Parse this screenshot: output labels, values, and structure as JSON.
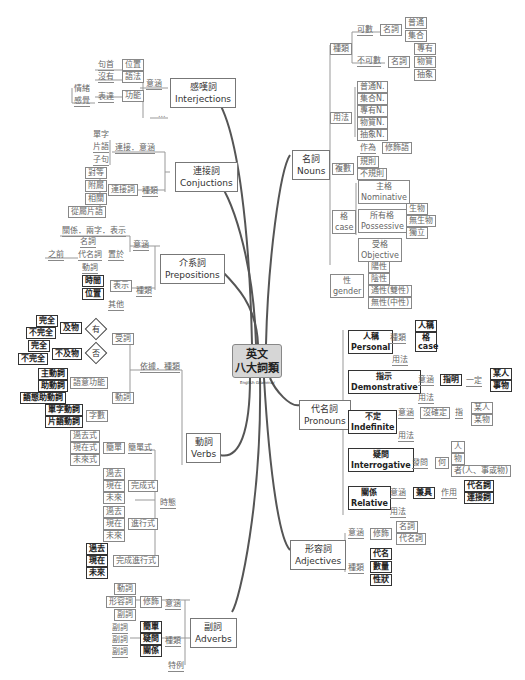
{
  "center": {
    "title_line1": "英文",
    "title_line2": "八大詞類",
    "subtitle": "English Grammar"
  },
  "interjections": {
    "zh": "感嘆詞",
    "en": "Interjections",
    "meaning": "意涵",
    "items": [
      {
        "left": "句首",
        "box": "位置"
      },
      {
        "left": "沒有",
        "box": "語法"
      },
      {
        "left": "表達",
        "box": "功能",
        "sub": [
          "情緒",
          "感覺"
        ]
      }
    ],
    "extra": "..."
  },
  "conjunctions": {
    "zh": "連接詞",
    "en": "Conjuctions",
    "meaning_label": "連接．意涵",
    "meaning_items": [
      "單字",
      "片語",
      "子句"
    ],
    "type_label": "種類",
    "type_box": "連接詞",
    "types": [
      "對等",
      "附屬",
      "相關",
      "從屬片語"
    ]
  },
  "prepositions": {
    "zh": "介系詞",
    "en": "Prepositions",
    "meaning": "意涵",
    "relation": "關係．兩字．表示",
    "placed": "置於",
    "before": "之前",
    "placed_items": [
      "名詞",
      "代名詞",
      "動詞"
    ],
    "type": "種類",
    "show": "表示",
    "show_items": [
      "時間",
      "位置"
    ],
    "other": "其他"
  },
  "verbs": {
    "zh": "動詞",
    "en": "Verbs",
    "basis": "依據．種類",
    "passive": "受詞",
    "yes": "有",
    "no": "否",
    "transitive": "及物",
    "intransitive": "不及物",
    "trans_items": [
      "完全",
      "不完全"
    ],
    "intrans_items": [
      "完全",
      "不完全"
    ],
    "verb": "動詞",
    "function": "語意功能",
    "function_items": [
      "主動詞",
      "助動詞",
      "語態助動詞"
    ],
    "count": "字數",
    "count_items": [
      "單字動詞",
      "片語動詞"
    ],
    "tense": "時態",
    "simple_label": "簡單式",
    "simple_box": "簡單",
    "simple_items": [
      "過去式",
      "現在式",
      "未來式"
    ],
    "perfect": "完成式",
    "perfect_items": [
      "過去",
      "現在",
      "未來"
    ],
    "progressive": "進行式",
    "progressive_items": [
      "過去",
      "現在",
      "未來"
    ],
    "perfect_progressive": "完成進行式",
    "pp_items": [
      "過去",
      "現在",
      "未來"
    ]
  },
  "adverbs": {
    "zh": "副詞",
    "en": "Adverbs",
    "meaning": "意涵",
    "modify": "修飾",
    "modify_items": [
      "動詞",
      "形容詞",
      "副詞"
    ],
    "type": "種類",
    "types": [
      {
        "left": "副詞",
        "box": "簡單"
      },
      {
        "left": "副詞",
        "box": "疑問"
      },
      {
        "left": "副詞",
        "box": "關係"
      }
    ],
    "special": "特例"
  },
  "nouns": {
    "zh": "名詞",
    "en": "Nouns",
    "kind": "種類",
    "countable": "可數",
    "uncountable": "不可數",
    "noun": "名詞",
    "countable_items": [
      "普通",
      "集合"
    ],
    "uncountable_items": [
      "專有",
      "物質",
      "抽象"
    ],
    "usage": "用法",
    "usage_items": [
      "普通N.",
      "集合N.",
      "專有N.",
      "物質N.",
      "抽象N."
    ],
    "as": "作為",
    "modifier": "修飾語",
    "plural": "複數",
    "plural_items": [
      "規則",
      "不規則"
    ],
    "case_zh": "格",
    "case_en": "case",
    "nominative_zh": "主格",
    "nominative_en": "Nominative",
    "possessive_zh": "所有格",
    "possessive_en": "Possessive",
    "possessive_items": [
      "生物",
      "無生物",
      "獨立"
    ],
    "objective_zh": "受格",
    "objective_en": "Objective",
    "gender_zh": "性",
    "gender_en": "gender",
    "gender_items": [
      "陽性",
      "陰性",
      "通性(雙性)",
      "無性(中性)"
    ]
  },
  "pronouns": {
    "zh": "代名詞",
    "en": "Pronouns",
    "personal_zh": "人稱",
    "personal_en": "Personal",
    "kind": "種類",
    "personal_items": [
      "人稱",
      "格 case"
    ],
    "usage": "用法",
    "demo_zh": "指示",
    "demo_en": "Demonstrative",
    "meaning": "意涵",
    "specify": "指明",
    "definite": "一定",
    "demo_items": [
      "某人",
      "事物"
    ],
    "indef_zh": "不定",
    "indef_en": "Indefinite",
    "uncertain": "沒確定",
    "refer": "指",
    "indef_items": [
      "某人",
      "某物"
    ],
    "inter_zh": "疑問",
    "inter_en": "Interrogative",
    "ask": "發問",
    "what": "何",
    "inter_items": [
      "人",
      "物",
      "者(人、事或物)"
    ],
    "rel_zh": "關係",
    "rel_en": "Relative",
    "dual": "兼具",
    "role": "作用",
    "rel_items": [
      "代名詞",
      "連接詞"
    ]
  },
  "adjectives": {
    "zh": "形容詞",
    "en": "Adjectives",
    "meaning": "意涵",
    "modify": "修飾",
    "modify_items": [
      "名詞",
      "代名詞"
    ],
    "type": "種類",
    "types": [
      "代名",
      "數量",
      "性狀"
    ]
  }
}
